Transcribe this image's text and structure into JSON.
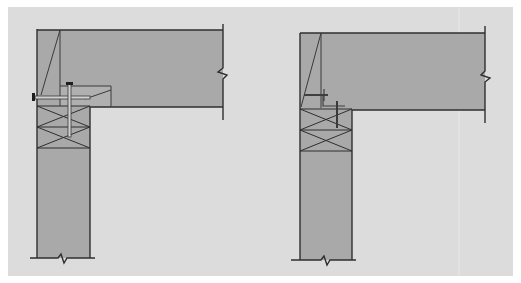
{
  "figure": {
    "title": "",
    "colors": {
      "page": "#ffffff",
      "panel": "#dcdcdc",
      "concrete": "#a9a9a9",
      "line": "#2f2f2f",
      "bolt": "#555555"
    }
  },
  "details": [
    {
      "id": "left",
      "label": "",
      "connection": "through-bolted angle with vertical anchor bolt"
    },
    {
      "id": "right",
      "label": "",
      "connection": "welded plate with vertical anchor"
    }
  ]
}
